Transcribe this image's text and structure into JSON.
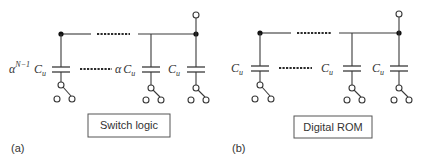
{
  "figure": {
    "panels": [
      {
        "id": "a",
        "panel_label": "(a)",
        "logic_block_label": "Switch logic",
        "capacitors": [
          {
            "position": "left",
            "label_prefix": "α",
            "label_sup": "N−1",
            "label_main": "C",
            "label_sub": "u"
          },
          {
            "position": "middle",
            "label_prefix": "α",
            "label_sup": "",
            "label_main": "C",
            "label_sub": "u"
          },
          {
            "position": "right",
            "label_prefix": "",
            "label_sup": "",
            "label_main": "C",
            "label_sub": "u"
          }
        ]
      },
      {
        "id": "b",
        "panel_label": "(b)",
        "logic_block_label": "Digital ROM",
        "capacitors": [
          {
            "position": "left",
            "label_prefix": "",
            "label_sup": "",
            "label_main": "C",
            "label_sub": "u"
          },
          {
            "position": "middle",
            "label_prefix": "",
            "label_sup": "",
            "label_main": "C",
            "label_sub": "u"
          },
          {
            "position": "right",
            "label_prefix": "",
            "label_sup": "",
            "label_main": "C",
            "label_sub": "u"
          }
        ]
      }
    ],
    "colors": {
      "wire": "#3a3a3a",
      "node": "#111111",
      "background": "#ffffff"
    }
  }
}
